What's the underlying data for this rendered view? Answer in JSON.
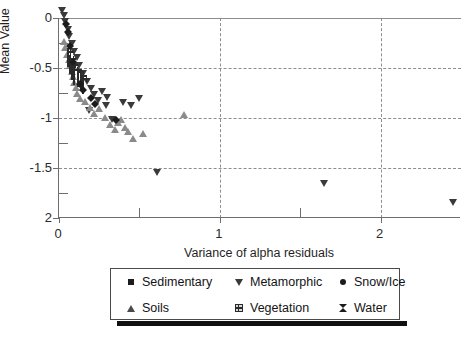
{
  "chart_data": {
    "type": "scatter",
    "title": "",
    "xlabel": "Variance of alpha residuals",
    "ylabel": "Mean Value",
    "xlim": [
      0,
      2.5
    ],
    "ylim": [
      -2,
      0
    ],
    "xticks": [
      "0",
      "1",
      "2"
    ],
    "xtick_values": [
      0,
      1,
      2
    ],
    "yticks": [
      "0",
      "-0.5",
      "-1",
      "-1.5",
      "2"
    ],
    "ytick_values": [
      0,
      -0.5,
      -1,
      -1.5,
      -2
    ],
    "grid": "dashed gridlines at y = 0, -0.5, -1, -1.5 and x = 1, 2",
    "legend_position": "below plot",
    "series": [
      {
        "name": "Sedimentary",
        "marker": "square",
        "color": "#1c1c1c",
        "points": [
          [
            0.012,
            -0.03
          ],
          [
            0.018,
            -0.07
          ],
          [
            0.022,
            -0.12
          ],
          [
            0.028,
            -0.17
          ],
          [
            0.035,
            -0.22
          ],
          [
            0.042,
            -0.29
          ],
          [
            0.05,
            -0.34
          ],
          [
            0.058,
            -0.4
          ],
          [
            0.072,
            -0.45
          ],
          [
            0.105,
            -0.5
          ],
          [
            0.088,
            -0.55
          ],
          [
            0.1,
            -0.6
          ],
          [
            0.012,
            -0.77
          ],
          [
            0.145,
            -0.7
          ],
          [
            0.165,
            -0.74
          ],
          [
            0.19,
            -0.82
          ],
          [
            0.205,
            -0.88
          ],
          [
            0.225,
            -0.93
          ],
          [
            0.62,
            -1.13
          ],
          [
            0.78,
            -1.23
          ]
        ]
      },
      {
        "name": "Metamorphic",
        "marker": "triangle-down",
        "color": "#3a3a3a",
        "points": [
          [
            0.02,
            -0.05
          ],
          [
            0.03,
            -0.1
          ],
          [
            0.04,
            -0.16
          ],
          [
            0.055,
            -0.24
          ],
          [
            0.065,
            -0.31
          ],
          [
            0.08,
            -0.38
          ],
          [
            0.095,
            -0.46
          ],
          [
            0.11,
            -0.52
          ],
          [
            0.125,
            -0.6
          ],
          [
            0.15,
            -0.68
          ],
          [
            0.175,
            -0.76
          ],
          [
            0.2,
            -0.83
          ],
          [
            0.215,
            -0.89
          ],
          [
            0.24,
            -0.95
          ],
          [
            0.265,
            -0.86
          ],
          [
            0.295,
            -1.0
          ],
          [
            0.33,
            -1.14
          ],
          [
            0.4,
            -0.97
          ],
          [
            0.445,
            -1.0
          ],
          [
            0.3,
            -0.92
          ],
          [
            0.185,
            -1.05
          ],
          [
            0.5,
            -0.93
          ],
          [
            0.61,
            -1.67
          ],
          [
            1.65,
            -1.78
          ],
          [
            2.45,
            -1.97
          ]
        ]
      },
      {
        "name": "Snow/Ice",
        "marker": "circle",
        "color": "#1c1c1c",
        "points": [
          [
            0.008,
            -0.01
          ],
          [
            0.01,
            -0.04
          ],
          [
            0.014,
            -0.08
          ],
          [
            0.02,
            -0.13
          ],
          [
            0.026,
            -0.19
          ],
          [
            0.032,
            -0.26
          ],
          [
            0.045,
            -0.33
          ],
          [
            0.05,
            -0.42
          ],
          [
            0.062,
            -0.49
          ],
          [
            0.075,
            -0.56
          ],
          [
            0.09,
            -0.63
          ],
          [
            0.115,
            -0.7
          ],
          [
            0.34,
            -1.04
          ]
        ]
      },
      {
        "name": "Soils",
        "marker": "triangle-up",
        "color": "#8a8a8a",
        "points": [
          [
            0.03,
            -0.12
          ],
          [
            0.04,
            -0.18
          ],
          [
            0.05,
            -0.25
          ],
          [
            0.06,
            -0.3
          ],
          [
            0.07,
            -0.36
          ],
          [
            0.078,
            -0.42
          ],
          [
            0.085,
            -0.47
          ],
          [
            0.095,
            -0.53
          ],
          [
            0.105,
            -0.58
          ],
          [
            0.115,
            -0.64
          ],
          [
            0.13,
            -0.69
          ],
          [
            0.16,
            -0.72
          ],
          [
            0.195,
            -0.78
          ],
          [
            0.22,
            -0.84
          ],
          [
            0.25,
            -0.79
          ],
          [
            0.285,
            -0.88
          ],
          [
            0.315,
            -0.95
          ],
          [
            0.35,
            -1.0
          ],
          [
            0.365,
            -0.93
          ],
          [
            0.385,
            -0.9
          ],
          [
            0.41,
            -0.98
          ],
          [
            0.43,
            -1.02
          ],
          [
            0.46,
            -1.09
          ],
          [
            0.52,
            -1.04
          ],
          [
            0.78,
            -0.85
          ]
        ]
      },
      {
        "name": "Vegetation",
        "marker": "grid-square",
        "color": "#d8d8d8",
        "points": [
          [
            0.055,
            -0.4
          ],
          [
            0.07,
            -0.47
          ],
          [
            0.082,
            -0.53
          ],
          [
            0.095,
            -0.58
          ],
          [
            0.118,
            -0.6
          ],
          [
            0.135,
            -0.64
          ],
          [
            0.15,
            -0.67
          ]
        ]
      },
      {
        "name": "Water",
        "marker": "bowtie",
        "color": "#1c1c1c",
        "points": [
          [
            0.02,
            -0.06
          ],
          [
            0.03,
            -0.14
          ],
          [
            0.045,
            -0.28
          ],
          [
            0.06,
            -0.44
          ],
          [
            0.105,
            -0.66
          ],
          [
            0.125,
            -0.72
          ],
          [
            0.175,
            -0.8
          ],
          [
            0.2,
            -0.86
          ],
          [
            0.33,
            -1.02
          ]
        ]
      }
    ]
  },
  "legend": {
    "items": [
      {
        "label": "Sedimentary",
        "marker": "square"
      },
      {
        "label": "Metamorphic",
        "marker": "triangle-down"
      },
      {
        "label": "Snow/Ice",
        "marker": "circle"
      },
      {
        "label": "Soils",
        "marker": "triangle-up"
      },
      {
        "label": "Vegetation",
        "marker": "grid-square"
      },
      {
        "label": "Water",
        "marker": "bowtie"
      }
    ]
  }
}
